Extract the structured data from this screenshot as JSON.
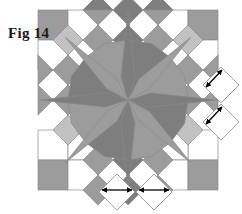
{
  "figure": {
    "label": "Fig 14",
    "title": "Fig 14",
    "type": "quilt-block-diagram",
    "pattern_name": "Broken Star",
    "width": 242,
    "height": 214
  },
  "colors": {
    "background": "#ffffff",
    "white_patch": "#ffffff",
    "light_gray": "#c2c2c2",
    "medium_gray": "#9c9c9c",
    "dark_gray": "#7e7e7e",
    "outline": "#8a8a8a",
    "arrow": "#000000",
    "label_text": "#1a1a1a"
  },
  "geometry": {
    "grid_origin_x": 38,
    "grid_origin_y": 10,
    "cell": 30,
    "cols": 6,
    "rows": 6,
    "center_x": 128,
    "center_y": 100
  },
  "chart_data": {
    "type": "diagram",
    "title": "Fig 14",
    "value_levels": [
      "white",
      "light_gray",
      "medium_gray",
      "dark_gray"
    ],
    "center_star_points": 8,
    "annotation_count": 4
  },
  "annotations": {
    "right": [
      {
        "name": "right-upper-diamond",
        "cx": 221,
        "cy": 85,
        "arrow": "double-headed",
        "edge": "upper-left"
      },
      {
        "name": "right-lower-diamond",
        "cx": 221,
        "cy": 122,
        "arrow": "double-headed",
        "edge": "upper-left"
      }
    ],
    "bottom": [
      {
        "name": "bottom-left-diamond",
        "cx": 117,
        "cy": 192,
        "arrow": "double-headed",
        "edge": "upper"
      },
      {
        "name": "bottom-right-diamond",
        "cx": 154,
        "cy": 192,
        "arrow": "double-headed",
        "edge": "upper"
      }
    ]
  },
  "legend": {
    "white_label": "white",
    "light_label": "light",
    "medium_label": "medium",
    "dark_label": "dark"
  }
}
